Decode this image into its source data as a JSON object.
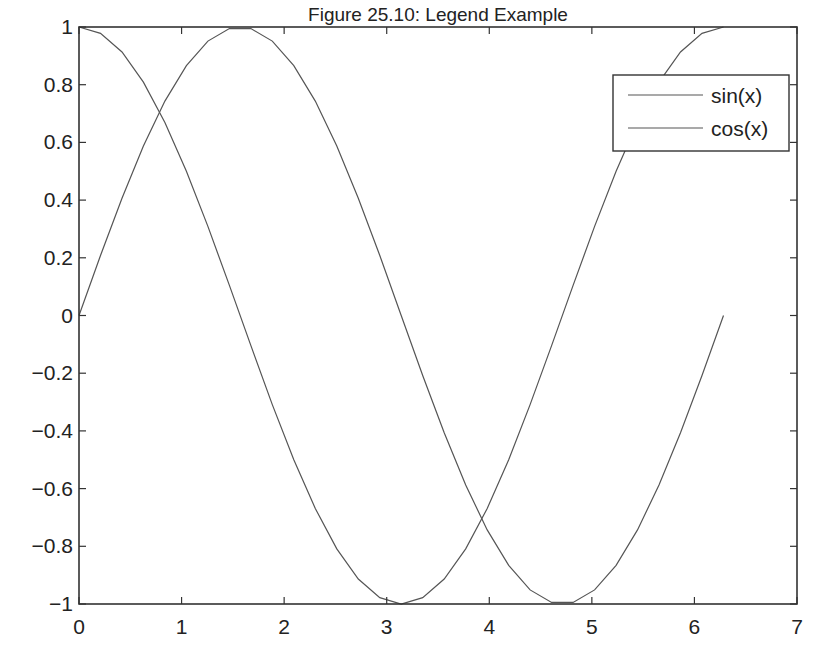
{
  "chart_data": {
    "type": "line",
    "title": "Figure 25.10: Legend Example",
    "xlabel": "",
    "ylabel": "",
    "xlim": [
      0,
      7
    ],
    "ylim": [
      -1,
      1
    ],
    "xticks": [
      0,
      1,
      2,
      3,
      4,
      5,
      6,
      7
    ],
    "xtick_labels": [
      "0",
      "1",
      "2",
      "3",
      "4",
      "5",
      "6",
      "7"
    ],
    "yticks": [
      -1,
      -0.8,
      -0.6,
      -0.4,
      -0.2,
      0,
      0.2,
      0.4,
      0.6,
      0.8,
      1
    ],
    "ytick_labels": [
      "−1",
      "−0.8",
      "−0.6",
      "−0.4",
      "−0.2",
      "0",
      "0.2",
      "0.4",
      "0.6",
      "0.8",
      "1"
    ],
    "grid": false,
    "legend_position": "upper right",
    "x": [
      0,
      0.2094,
      0.4189,
      0.6283,
      0.8378,
      1.0472,
      1.2566,
      1.4661,
      1.6755,
      1.885,
      2.0944,
      2.3038,
      2.5133,
      2.7227,
      2.9322,
      3.1416,
      3.351,
      3.5605,
      3.7699,
      3.9794,
      4.1888,
      4.3982,
      4.6077,
      4.8171,
      5.0265,
      5.236,
      5.4454,
      5.6549,
      5.8643,
      6.0737,
      6.2832
    ],
    "series": [
      {
        "name": "sin(x)",
        "color": "#555555",
        "values": [
          0,
          0.2079,
          0.4067,
          0.5878,
          0.7431,
          0.866,
          0.9511,
          0.9945,
          0.9945,
          0.9511,
          0.866,
          0.7431,
          0.5878,
          0.4067,
          0.2079,
          0,
          -0.2079,
          -0.4067,
          -0.5878,
          -0.7431,
          -0.866,
          -0.9511,
          -0.9945,
          -0.9945,
          -0.9511,
          -0.866,
          -0.7431,
          -0.5878,
          -0.4067,
          -0.2079,
          0
        ]
      },
      {
        "name": "cos(x)",
        "color": "#555555",
        "values": [
          1,
          0.9781,
          0.9135,
          0.809,
          0.6691,
          0.5,
          0.309,
          0.1045,
          -0.1045,
          -0.309,
          -0.5,
          -0.6691,
          -0.809,
          -0.9135,
          -0.9781,
          -1,
          -0.9781,
          -0.9135,
          -0.809,
          -0.6691,
          -0.5,
          -0.309,
          -0.1045,
          0.1045,
          0.309,
          0.5,
          0.6691,
          0.809,
          0.9135,
          0.9781,
          1
        ]
      }
    ]
  }
}
